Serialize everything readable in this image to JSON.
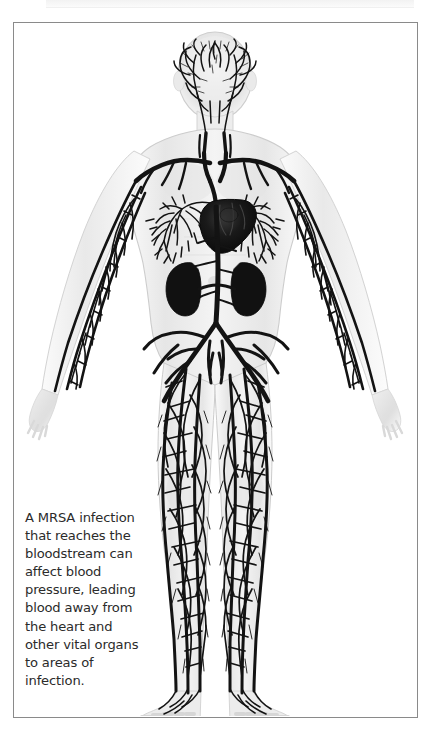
{
  "panel": {
    "title": "human-circulatory-system-illustration",
    "border_color": "#8a8a8a",
    "background_color": "#ffffff"
  },
  "caption": {
    "text": "A MRSA infection that reaches the bloodstream can affect blood pressure, leading blood away from the heart and other vital organs to areas of infection.",
    "color": "#2b2b2b"
  },
  "illustration": {
    "subject": "anatomical-male-figure-anterior-view",
    "body_tone": "#ededed",
    "body_outline": "#cfcfcf",
    "vessel_color": "#131313",
    "organ_color": "#111111",
    "parts": [
      {
        "name": "head",
        "label": "Head with cerebral vasculature"
      },
      {
        "name": "neck",
        "label": "Neck with carotid arteries"
      },
      {
        "name": "shoulders",
        "label": "Shoulders with subclavian arteries"
      },
      {
        "name": "heart",
        "label": "Heart"
      },
      {
        "name": "lungs",
        "label": "Lungs with pulmonary vascular tree"
      },
      {
        "name": "aorta",
        "label": "Descending aorta"
      },
      {
        "name": "kidney-left",
        "label": "Left kidney"
      },
      {
        "name": "kidney-right",
        "label": "Right kidney"
      },
      {
        "name": "pelvis",
        "label": "Pelvis with iliac arteries"
      },
      {
        "name": "arm-left",
        "label": "Left arm vasculature"
      },
      {
        "name": "arm-right",
        "label": "Right arm vasculature"
      },
      {
        "name": "hand-left",
        "label": "Left hand"
      },
      {
        "name": "hand-right",
        "label": "Right hand"
      },
      {
        "name": "leg-left",
        "label": "Left leg vasculature"
      },
      {
        "name": "leg-right",
        "label": "Right leg vasculature"
      },
      {
        "name": "foot-left",
        "label": "Left foot"
      },
      {
        "name": "foot-right",
        "label": "Right foot"
      }
    ]
  }
}
